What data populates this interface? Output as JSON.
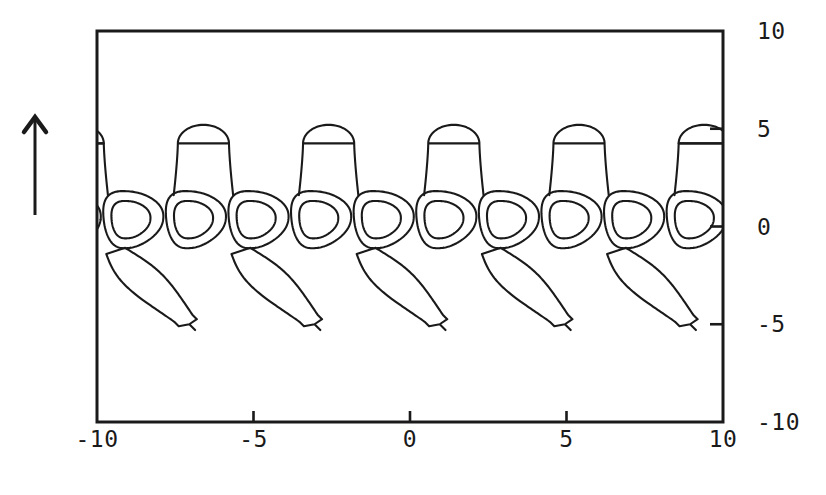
{
  "figure": {
    "kind": "contour-plot",
    "background_color": "#ffffff",
    "ink_color": "#1a1a1a",
    "frame": {
      "x_left_px": 97,
      "y_top_px": 31,
      "x_right_px": 723,
      "y_bottom_px": 422,
      "border_width_px": 3
    },
    "arrow": {
      "name": "up-arrow",
      "x_px": 35,
      "y_top_px": 117,
      "y_bottom_px": 215,
      "stroke_width_px": 3
    }
  },
  "chart_data": {
    "type": "line",
    "title": "",
    "subtitle": "",
    "xlabel": "",
    "ylabel": "",
    "xlim": [
      -10,
      10
    ],
    "ylim": [
      -10,
      10
    ],
    "grid": false,
    "legend": null,
    "x_tick_labels": [
      "-10",
      "-5",
      "0",
      "5",
      "10"
    ],
    "x_tick_values": [
      -10,
      -5,
      0,
      5,
      10
    ],
    "x_ticks_drawn_at": [
      -5,
      0,
      5
    ],
    "y_tick_labels": [
      "10",
      "5",
      "0",
      "-5",
      "-10"
    ],
    "y_tick_values": [
      10,
      5,
      0,
      -5,
      -10
    ],
    "y_ticks_drawn_at": [
      5,
      0,
      -5
    ],
    "y_axis_side": "right",
    "pattern": {
      "cell_period_x": 2.0,
      "cell_phase_x": -9.0,
      "lobe_period_x": 4.0,
      "lobe_phase_x": -6.6,
      "tail_period_x": 4.0,
      "tail_phase_x": -9.4,
      "cell_center_y": 0.35,
      "inner_oval_rx": 0.62,
      "inner_oval_ry": 0.95,
      "mid_oval_rx": 0.95,
      "mid_oval_ry": 1.45,
      "lobe_top_y": 5.2,
      "lobe_half_width": 0.95,
      "lobe_base_y": 1.6,
      "tail_tip_y": -5.0,
      "tail_tip_dx": 2.35,
      "tail_band_half": 0.55,
      "outer_band_y": -2.6
    },
    "series": [
      {
        "name": "inner-oval-contour",
        "level": 3,
        "count": 11
      },
      {
        "name": "mid-oval-contour",
        "level": 2,
        "count": 11
      },
      {
        "name": "upward-lobe-contour",
        "level": 1,
        "count": 6
      },
      {
        "name": "downward-tail-contour",
        "level": 1,
        "count": 6
      }
    ]
  },
  "axis": {
    "x_labels": [
      "-10",
      "-5",
      "0",
      "5",
      "10"
    ],
    "y_labels": [
      "10",
      "5",
      "0",
      "-5",
      "-10"
    ]
  }
}
